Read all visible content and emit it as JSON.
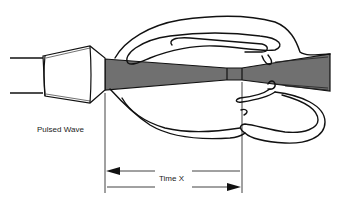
{
  "diagram": {
    "type": "ultrasound-pulsed-wave-doppler",
    "labels": {
      "mode": "Pulsed Wave",
      "time": "Time X"
    },
    "components": {
      "transducer": "transducer-probe",
      "beam": "ultrasound-beam",
      "sample_gate": "sample-volume-gate",
      "vessels": "blood-vessel-outline"
    },
    "colors": {
      "beam_fill": "#707070",
      "stroke": "#111111",
      "background": "#ffffff"
    }
  }
}
